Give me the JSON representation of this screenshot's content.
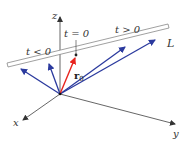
{
  "diagram": {
    "axes": {
      "z_label": "z",
      "x_label": "x",
      "y_label": "y"
    },
    "line_label": "L",
    "annotations": {
      "t_neg": "t < 0",
      "t_zero": "t = 0",
      "t_pos": "t > 0",
      "r0_label": "r",
      "r0_sub": "0"
    },
    "colors": {
      "axis": "#555555",
      "vectors": "#2b3a9e",
      "r0_vector": "#e8241e",
      "line": "#888888"
    }
  }
}
